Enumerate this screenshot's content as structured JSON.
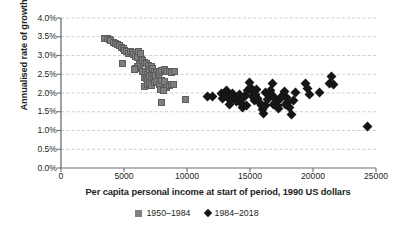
{
  "chart_data": {
    "type": "scatter",
    "title": "",
    "xlabel": "Per capita personal income at start of period, 1990 US dollars",
    "ylabel": "Annualised rate of growth",
    "xlim": [
      0,
      25000
    ],
    "ylim": [
      0,
      4.0
    ],
    "xticks": [
      "0",
      "5000",
      "10000",
      "15000",
      "20000",
      "25000"
    ],
    "xtick_values": [
      0,
      5000,
      10000,
      15000,
      20000,
      25000
    ],
    "yticks": [
      "0.0%",
      "0.5%",
      "1.0%",
      "1.5%",
      "2.0%",
      "2.5%",
      "3.0%",
      "3.5%",
      "4.0%"
    ],
    "ytick_values": [
      0,
      0.5,
      1.0,
      1.5,
      2.0,
      2.5,
      3.0,
      3.5,
      4.0
    ],
    "grid": "horizontal-dashed",
    "legend_position": "bottom-center",
    "series": [
      {
        "name": "1950–1984",
        "marker": "square",
        "color": "#7f7f7f",
        "points": [
          [
            3450,
            3.45
          ],
          [
            3700,
            3.46
          ],
          [
            3850,
            3.42
          ],
          [
            3950,
            3.4
          ],
          [
            4150,
            3.36
          ],
          [
            4300,
            3.33
          ],
          [
            4500,
            3.3
          ],
          [
            4650,
            3.27
          ],
          [
            4800,
            3.22
          ],
          [
            4950,
            3.18
          ],
          [
            5050,
            3.13
          ],
          [
            5200,
            3.1
          ],
          [
            4900,
            2.8
          ],
          [
            5350,
            3.06
          ],
          [
            5500,
            3.12
          ],
          [
            5650,
            3.08
          ],
          [
            5750,
            3.02
          ],
          [
            5900,
            2.98
          ],
          [
            6050,
            2.94
          ],
          [
            6150,
            3.1
          ],
          [
            6300,
            3.05
          ],
          [
            6400,
            2.9
          ],
          [
            6250,
            2.76
          ],
          [
            6100,
            2.7
          ],
          [
            5950,
            2.66
          ],
          [
            5800,
            2.62
          ],
          [
            6500,
            2.86
          ],
          [
            6650,
            2.82
          ],
          [
            6800,
            2.78
          ],
          [
            6950,
            2.74
          ],
          [
            6500,
            2.58
          ],
          [
            6700,
            2.54
          ],
          [
            6850,
            2.5
          ],
          [
            7000,
            2.62
          ],
          [
            7150,
            2.7
          ],
          [
            7300,
            2.66
          ],
          [
            7450,
            2.58
          ],
          [
            7600,
            2.54
          ],
          [
            6600,
            2.42
          ],
          [
            6750,
            2.38
          ],
          [
            6900,
            2.34
          ],
          [
            7050,
            2.44
          ],
          [
            7200,
            2.4
          ],
          [
            7350,
            2.36
          ],
          [
            7500,
            2.46
          ],
          [
            7700,
            2.5
          ],
          [
            7850,
            2.56
          ],
          [
            8000,
            2.6
          ],
          [
            8200,
            2.62
          ],
          [
            8400,
            2.57
          ],
          [
            8600,
            2.58
          ],
          [
            8800,
            2.56
          ],
          [
            9000,
            2.57
          ],
          [
            6650,
            2.18
          ],
          [
            6850,
            2.22
          ],
          [
            7000,
            2.26
          ],
          [
            7200,
            2.2
          ],
          [
            7400,
            2.28
          ],
          [
            7600,
            2.3
          ],
          [
            7800,
            2.24
          ],
          [
            8000,
            2.34
          ],
          [
            8200,
            2.3
          ],
          [
            8400,
            2.14
          ],
          [
            8600,
            2.2
          ],
          [
            8750,
            2.24
          ],
          [
            8900,
            2.22
          ],
          [
            7900,
            2.1
          ],
          [
            8100,
            2.06
          ],
          [
            8000,
            1.75
          ],
          [
            9900,
            1.82
          ]
        ]
      },
      {
        "name": "1984–2018",
        "marker": "diamond",
        "color": "#161616",
        "points": [
          [
            11600,
            1.9
          ],
          [
            12000,
            1.91
          ],
          [
            12750,
            1.98
          ],
          [
            12950,
            1.93
          ],
          [
            13100,
            2.06
          ],
          [
            13250,
            1.88
          ],
          [
            13400,
            1.95
          ],
          [
            13500,
            1.84
          ],
          [
            13650,
            2.0
          ],
          [
            13800,
            1.9
          ],
          [
            13900,
            1.78
          ],
          [
            14000,
            1.86
          ],
          [
            14150,
            1.96
          ],
          [
            14300,
            1.72
          ],
          [
            14400,
            1.62
          ],
          [
            14500,
            1.88
          ],
          [
            14650,
            1.94
          ],
          [
            14800,
            2.06
          ],
          [
            14950,
            2.28
          ],
          [
            15050,
            2.14
          ],
          [
            15200,
            1.9
          ],
          [
            15350,
            1.8
          ],
          [
            15450,
            1.96
          ],
          [
            15600,
            1.86
          ],
          [
            15750,
            1.74
          ],
          [
            15900,
            1.68
          ],
          [
            16000,
            1.56
          ],
          [
            16100,
            1.46
          ],
          [
            16250,
            1.66
          ],
          [
            16400,
            1.82
          ],
          [
            16500,
            1.96
          ],
          [
            16650,
            2.08
          ],
          [
            16750,
            2.26
          ],
          [
            16900,
            1.9
          ],
          [
            17000,
            1.76
          ],
          [
            17150,
            1.66
          ],
          [
            17300,
            1.58
          ],
          [
            17450,
            1.86
          ],
          [
            17600,
            1.94
          ],
          [
            17750,
            2.04
          ],
          [
            17900,
            1.88
          ],
          [
            18000,
            1.74
          ],
          [
            18150,
            1.62
          ],
          [
            18300,
            1.42
          ],
          [
            18450,
            1.8
          ],
          [
            18600,
            2.02
          ],
          [
            19400,
            2.26
          ],
          [
            19550,
            2.12
          ],
          [
            19700,
            1.95
          ],
          [
            20500,
            2.02
          ],
          [
            21300,
            2.25
          ],
          [
            21500,
            2.43
          ],
          [
            21600,
            2.22
          ],
          [
            24300,
            1.12
          ],
          [
            15150,
            2.08
          ],
          [
            16200,
            2.02
          ],
          [
            13350,
            1.7
          ],
          [
            14700,
            1.68
          ],
          [
            17800,
            1.7
          ],
          [
            12850,
            1.86
          ],
          [
            16850,
            1.7
          ],
          [
            15500,
            2.1
          ]
        ]
      }
    ]
  },
  "axis": {
    "color": "#6d6e71",
    "gridline_color": "#b9c4d4"
  }
}
